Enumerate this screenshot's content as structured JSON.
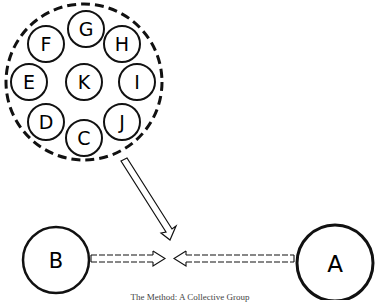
{
  "diagram": {
    "group_label": "collective group",
    "group_members": [
      {
        "id": "G",
        "label": "G",
        "cx": 86,
        "cy": 29
      },
      {
        "id": "H",
        "label": "H",
        "cx": 122,
        "cy": 44
      },
      {
        "id": "I",
        "label": "I",
        "cx": 137,
        "cy": 82
      },
      {
        "id": "J",
        "label": "J",
        "cx": 122,
        "cy": 122
      },
      {
        "id": "C",
        "label": "C",
        "cx": 84,
        "cy": 138
      },
      {
        "id": "D",
        "label": "D",
        "cx": 46,
        "cy": 122
      },
      {
        "id": "E",
        "label": "E",
        "cx": 29,
        "cy": 82
      },
      {
        "id": "F",
        "label": "F",
        "cx": 46,
        "cy": 44
      },
      {
        "id": "K",
        "label": "K",
        "cx": 84,
        "cy": 82
      }
    ],
    "node_b": {
      "label": "B"
    },
    "node_a": {
      "label": "A"
    },
    "colors": {
      "stroke": "#111111",
      "background": "#ffffff"
    }
  },
  "caption": "The Method: A Collective Group"
}
